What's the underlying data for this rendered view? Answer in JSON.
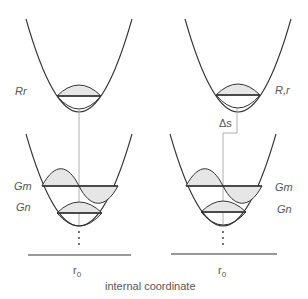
{
  "diagram": {
    "left_panel": {
      "upper_state_label": "Rr",
      "lower_state_labels": [
        "Gm",
        "Gn"
      ],
      "origin_label": "r0"
    },
    "right_panel": {
      "upper_state_label": "R,r",
      "displacement_label": "Δs",
      "lower_state_labels": [
        "Gm",
        "Gn"
      ],
      "origin_label": "r0"
    },
    "x_axis_label": "internal coordinate",
    "colors": {
      "curve": "#333333",
      "fill": "#e6e6e6",
      "guide": "#999999"
    }
  }
}
